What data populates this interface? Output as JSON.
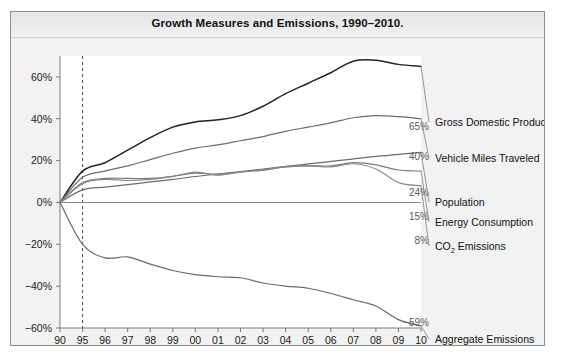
{
  "figure": {
    "title": "Growth Measures and Emissions, 1990–2010.",
    "background_color": "#f2f2f2",
    "plot_background_color": "#ffffff",
    "frame_color": "#8d8d8d"
  },
  "chart_data": {
    "type": "line",
    "title": "Growth Measures and Emissions, 1990–2010.",
    "xlabel": "",
    "ylabel": "",
    "grid": false,
    "legend_position": "right-inline",
    "ylim": [
      -60,
      70
    ],
    "yticks": [
      60,
      40,
      20,
      0,
      -20,
      -40,
      -60
    ],
    "ytick_labels": [
      "60%",
      "40%",
      "20%",
      "0%",
      "−20%",
      "−40%",
      "−60%"
    ],
    "x": [
      "90",
      "95",
      "96",
      "97",
      "98",
      "99",
      "00",
      "01",
      "02",
      "03",
      "04",
      "05",
      "06",
      "07",
      "08",
      "09",
      "10"
    ],
    "xtick_labels": [
      "90",
      "95",
      "96",
      "97",
      "98",
      "99",
      "00",
      "01",
      "02",
      "03",
      "04",
      "05",
      "06",
      "07",
      "08",
      "09",
      "10"
    ],
    "axis_break_note": "x axis jumps from 1990 to 1995, then annual",
    "reference_line_x": "95",
    "zero_line_y": 0,
    "series": [
      {
        "name": "Gross Domestic Product",
        "label": "Gross Domestic Product",
        "end_value_label": "65%",
        "color": "#222222",
        "values": [
          0,
          15,
          19,
          25,
          31,
          36,
          38.5,
          39.5,
          41.5,
          46,
          52,
          57,
          62,
          67.5,
          68,
          66,
          65
        ]
      },
      {
        "name": "Vehicle Miles Traveled",
        "label": "Vehicle Miles Traveled",
        "end_value_label": "40%",
        "color": "#6b6b6b",
        "values": [
          0,
          12,
          15,
          17.5,
          20.5,
          23.5,
          26,
          27.5,
          29.5,
          31.5,
          34,
          36,
          38,
          40.5,
          41.5,
          41,
          40
        ]
      },
      {
        "name": "Population",
        "label": "Population",
        "end_value_label": "24%",
        "color": "#6b6b6b",
        "values": [
          0,
          6,
          7.3,
          8.5,
          9.8,
          11,
          12.4,
          13.6,
          14.8,
          16,
          17.2,
          18.4,
          19.6,
          20.8,
          22,
          23,
          24
        ]
      },
      {
        "name": "Energy Consumption",
        "label": "Energy Consumption",
        "end_value_label": "15%",
        "color": "#7a7a7a",
        "values": [
          0,
          9.5,
          11.5,
          11.5,
          11.5,
          12.5,
          14,
          13.5,
          14.5,
          15.5,
          17,
          17.5,
          17.5,
          19,
          18,
          15.5,
          15
        ]
      },
      {
        "name": "CO₂ Emissions",
        "label_pre": "CO",
        "label_sub": "2",
        "label_post": " Emissions",
        "end_value_label": "8%",
        "color": "#8a8a8a",
        "values": [
          0,
          9,
          11,
          10.5,
          11,
          12.5,
          14.5,
          13,
          14.5,
          15.5,
          17,
          17.5,
          17,
          18.5,
          16,
          9.5,
          8
        ]
      },
      {
        "name": "Aggregate Emissions (Six Common Pollutants)",
        "label_line1": "Aggregate Emissions",
        "label_line2": "(Six Common Pollutants)",
        "end_value_label": "−59%",
        "color": "#6b6b6b",
        "values": [
          0,
          -20,
          -26.5,
          -26,
          -29.5,
          -32.5,
          -34.5,
          -35.5,
          -36,
          -38.5,
          -40,
          -41,
          -43.5,
          -46.5,
          -49.5,
          -56,
          -59
        ]
      }
    ]
  }
}
